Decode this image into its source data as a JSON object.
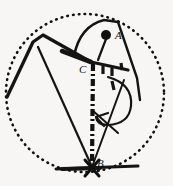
{
  "figure": {
    "name": "geometric-rotation-diagram",
    "background_color": "#f7f6f4",
    "ink_color": "#111111",
    "width": 173,
    "height": 186,
    "labels": {
      "a": "A",
      "b": "B",
      "c": "C"
    },
    "points": {
      "a": {
        "label": "A",
        "x": 106,
        "y": 35,
        "marker": "filled-dot",
        "radius": 5
      },
      "b": {
        "label": "B",
        "x": 92,
        "y": 167,
        "marker": "vertex-cross"
      },
      "c": {
        "label": "C",
        "x": 91,
        "y": 62,
        "marker": "vertex"
      }
    },
    "elements": {
      "boundary_circle": {
        "name": "dotted-boundary-circle",
        "cx": 85,
        "cy": 93,
        "r": 79,
        "style": "dotted"
      },
      "segment_ac": {
        "name": "segment-a-to-c",
        "from": "A",
        "to": "C",
        "style": "solid-thin"
      },
      "segment_cb": {
        "name": "segment-c-to-b",
        "from": "C",
        "to": "B",
        "style": "dash-dot-thick"
      },
      "rotation_arrow": {
        "name": "curved-rotation-arrow",
        "style": "solid-thin-curve-with-arrowhead"
      },
      "baseline": {
        "name": "horizontal-baseline-through-b",
        "style": "solid-thick"
      },
      "hatch_marks": {
        "name": "hatch-tick-marks",
        "count": 4
      }
    }
  }
}
